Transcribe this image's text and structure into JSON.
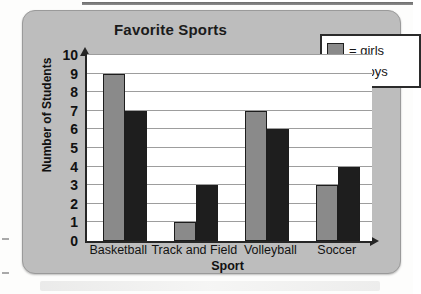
{
  "chart_data": {
    "type": "bar",
    "title": "Favorite Sports",
    "xlabel": "Sport",
    "ylabel": "Number of Students",
    "categories": [
      "Basketball",
      "Track and Field",
      "Volleyball",
      "Soccer"
    ],
    "series": [
      {
        "name": "= girls",
        "key": "girls",
        "color": "#8a8a8a",
        "values": [
          9,
          1,
          7,
          3
        ]
      },
      {
        "name": "= boys",
        "key": "boys",
        "color": "#1e1e1e",
        "values": [
          7,
          3,
          6,
          4
        ]
      }
    ],
    "ylim": [
      0,
      10
    ],
    "yticks": [
      10,
      9,
      8,
      7,
      6,
      5,
      4,
      3,
      2,
      1,
      0
    ],
    "grid": true,
    "legend_position": "top-right"
  },
  "legend": {
    "girls_label": "= girls",
    "boys_label": "= boys"
  },
  "colors": {
    "girls": "#8a8a8a",
    "boys": "#1e1e1e",
    "card": "#bdbdbd",
    "plot_background": "#ffffff",
    "axis": "#262626",
    "gridline": "#9d9d9d"
  }
}
